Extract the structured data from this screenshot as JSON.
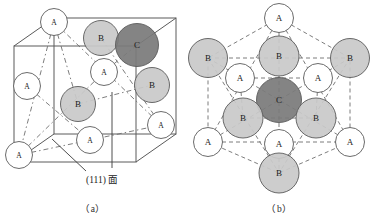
{
  "figure": {
    "colors": {
      "outline": "#5a5a5a",
      "dashed": "#6e6e6e",
      "atom_a_fill": "#ffffff",
      "atom_b_fill": "#c9c9c9",
      "atom_c_fill": "#7a7a7a",
      "text": "#1a1a1a",
      "background": "#ffffff"
    },
    "panels": [
      {
        "id": "a",
        "caption": "（a）",
        "annotation": {
          "text": "(111) 面",
          "leader_count": 2
        },
        "atoms": [
          {
            "label": "A",
            "cx": 54,
            "cy": 22,
            "r": 13.5,
            "type": "A"
          },
          {
            "label": "B",
            "cx": 101,
            "cy": 38,
            "r": 17.5,
            "type": "B"
          },
          {
            "label": "C",
            "cx": 137,
            "cy": 45,
            "r": 21.5,
            "type": "C"
          },
          {
            "label": "A",
            "cx": 104,
            "cy": 72,
            "r": 13.5,
            "type": "A"
          },
          {
            "label": "B",
            "cx": 152,
            "cy": 85,
            "r": 17.5,
            "type": "B"
          },
          {
            "label": "A",
            "cx": 27,
            "cy": 86,
            "r": 13.5,
            "type": "A"
          },
          {
            "label": "B",
            "cx": 78,
            "cy": 104,
            "r": 17.5,
            "type": "B"
          },
          {
            "label": "A",
            "cx": 161,
            "cy": 125,
            "r": 13.5,
            "type": "A"
          },
          {
            "label": "A",
            "cx": 90,
            "cy": 140,
            "r": 13.5,
            "type": "A"
          },
          {
            "label": "A",
            "cx": 19,
            "cy": 155,
            "r": 13.5,
            "type": "A"
          }
        ]
      },
      {
        "id": "b",
        "caption": "（b）",
        "atoms": [
          {
            "label": "A",
            "cx": 93,
            "cy": 18,
            "r": 14.5,
            "type": "A"
          },
          {
            "label": "B",
            "cx": 22,
            "cy": 58,
            "r": 19.5,
            "type": "B"
          },
          {
            "label": "B",
            "cx": 93,
            "cy": 56,
            "r": 20.0,
            "type": "B"
          },
          {
            "label": "B",
            "cx": 164,
            "cy": 58,
            "r": 19.5,
            "type": "B"
          },
          {
            "label": "A",
            "cx": 54,
            "cy": 78,
            "r": 14.5,
            "type": "A"
          },
          {
            "label": "A",
            "cx": 132,
            "cy": 78,
            "r": 14.5,
            "type": "A"
          },
          {
            "label": "C",
            "cx": 93,
            "cy": 100,
            "r": 22.5,
            "type": "C"
          },
          {
            "label": "B",
            "cx": 57,
            "cy": 118,
            "r": 20.0,
            "type": "B"
          },
          {
            "label": "B",
            "cx": 130,
            "cy": 118,
            "r": 20.0,
            "type": "B"
          },
          {
            "label": "A",
            "cx": 22,
            "cy": 142,
            "r": 14.5,
            "type": "A"
          },
          {
            "label": "A",
            "cx": 93,
            "cy": 144,
            "r": 14.5,
            "type": "A"
          },
          {
            "label": "A",
            "cx": 164,
            "cy": 142,
            "r": 14.5,
            "type": "A"
          },
          {
            "label": "B",
            "cx": 93,
            "cy": 173,
            "r": 20.0,
            "type": "B"
          }
        ]
      }
    ]
  }
}
